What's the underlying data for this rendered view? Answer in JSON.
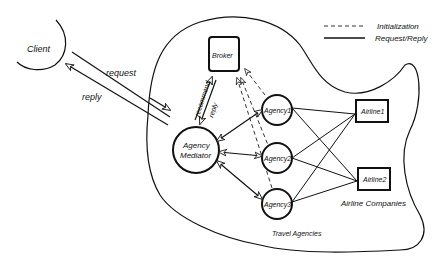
{
  "legend": {
    "initialization": "Initialization",
    "request_reply": "Request/Reply"
  },
  "nodes": {
    "client": "Client",
    "broker": "Broker",
    "mediator_line1": "Agency",
    "mediator_line2": "Mediator",
    "agency1": "Agency1",
    "agency2": "Agency2",
    "agency3": "Agency3",
    "airline1": "Airline1",
    "airline2": "Airline2"
  },
  "edges": {
    "request": "request",
    "reply": "reply",
    "recommend": "recommend",
    "broker_reply": "reply"
  },
  "groups": {
    "travel_agencies": "Travel Agencies",
    "airline_companies": "Airline Companies"
  }
}
